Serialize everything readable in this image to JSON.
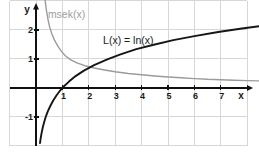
{
  "page": {
    "background": "#ffffff"
  },
  "chart_data": {
    "type": "line",
    "title": "",
    "subtitle": "",
    "canvas": {
      "width": 259,
      "height": 154
    },
    "grid": {
      "show": true,
      "color": "#d7d7d7"
    },
    "x_axis": {
      "label": "x",
      "value_range": [
        -1.364,
        8.447
      ],
      "grid_ticks": [
        -1,
        0,
        1,
        2,
        3,
        4,
        5,
        6,
        7,
        8
      ],
      "tick_values": [
        1,
        2,
        3,
        4,
        5,
        6,
        7
      ],
      "tick_labels": [
        "1",
        "2",
        "3",
        "4",
        "5",
        "6",
        "7"
      ]
    },
    "y_axis": {
      "label": "y",
      "value_range": [
        -2.276,
        3.034
      ],
      "grid_ticks": [
        -2,
        -1,
        0,
        1,
        2,
        3
      ],
      "tick_values": [
        -1,
        1,
        2
      ],
      "tick_labels": [
        "-1",
        "1",
        "2"
      ]
    },
    "axis_color": "#111111",
    "layout": {
      "tick_half_len": 2.5,
      "x_axis_line_from_value": -1,
      "x_axis_line_to_px": 248,
      "x_arrow_tip_px": 253,
      "y_axis_line_from_value": -2,
      "y_axis_line_to_px": 8,
      "y_arrow_tip_px": 3,
      "x_letter_px": [
        241,
        99
      ],
      "y_letter_px": [
        27,
        13
      ],
      "x_tick_label_dy": 11,
      "x_tick_label_dx": 1,
      "y_tick_label_x": 33,
      "y_tick_label_dy": 3
    },
    "series": [
      {
        "name": "msek(x)",
        "color": "#9b9b9b",
        "stroke_width": 1.4,
        "label": {
          "text": "msek(x)",
          "x": 0.45,
          "y": 2.43,
          "class": "curve-label-gray"
        },
        "points": [
          [
            0.34,
            3.05
          ],
          [
            0.39,
            2.7
          ],
          [
            0.45,
            2.38
          ],
          [
            0.52,
            2.1
          ],
          [
            0.6,
            1.87
          ],
          [
            0.7,
            1.65
          ],
          [
            0.82,
            1.45
          ],
          [
            0.95,
            1.28
          ],
          [
            1.1,
            1.12
          ],
          [
            1.3,
            0.98
          ],
          [
            1.55,
            0.87
          ],
          [
            1.85,
            0.77
          ],
          [
            2.2,
            0.69
          ],
          [
            2.6,
            0.62
          ],
          [
            3.0,
            0.56
          ],
          [
            3.5,
            0.5
          ],
          [
            4.0,
            0.455
          ],
          [
            4.5,
            0.415
          ],
          [
            5.0,
            0.38
          ],
          [
            5.5,
            0.35
          ],
          [
            6.0,
            0.325
          ],
          [
            6.5,
            0.3
          ],
          [
            7.0,
            0.285
          ],
          [
            7.5,
            0.27
          ],
          [
            8.0,
            0.255
          ],
          [
            8.45,
            0.245
          ]
        ]
      },
      {
        "name": "L(x) = ln(x)",
        "color": "#161616",
        "stroke_width": 1.9,
        "label": {
          "text": "L(x) = ln(x)",
          "x": 2.54,
          "y": 1.52,
          "class": "curve-label-dark"
        },
        "points": [
          [
            0.15,
            -1.9
          ],
          [
            0.17,
            -1.77
          ],
          [
            0.2,
            -1.61
          ],
          [
            0.23,
            -1.47
          ],
          [
            0.27,
            -1.31
          ],
          [
            0.32,
            -1.14
          ],
          [
            0.38,
            -0.97
          ],
          [
            0.45,
            -0.8
          ],
          [
            0.54,
            -0.62
          ],
          [
            0.65,
            -0.43
          ],
          [
            0.78,
            -0.25
          ],
          [
            0.92,
            -0.08
          ],
          [
            1.05,
            0.05
          ],
          [
            1.25,
            0.22
          ],
          [
            1.5,
            0.41
          ],
          [
            1.8,
            0.59
          ],
          [
            2.2,
            0.79
          ],
          [
            2.7,
            0.99
          ],
          [
            3.2,
            1.16
          ],
          [
            3.8,
            1.34
          ],
          [
            4.5,
            1.5
          ],
          [
            5.2,
            1.65
          ],
          [
            6.0,
            1.79
          ],
          [
            6.9,
            1.93
          ],
          [
            7.8,
            2.05
          ],
          [
            8.45,
            2.13
          ]
        ]
      }
    ]
  }
}
